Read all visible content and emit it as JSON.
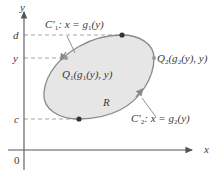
{
  "axes": {
    "x_label": "x",
    "y_label": "y",
    "origin_label": "0"
  },
  "y_ticks": {
    "d": "d",
    "y": "y",
    "c": "c"
  },
  "curves": {
    "c1_label": "C′",
    "c1_sub": "1",
    "c1_eq": ": x = g",
    "c1_eq_sub": "1",
    "c1_eq_tail": "(y)",
    "c2_label": "C′",
    "c2_sub": "2",
    "c2_eq": ": x = g",
    "c2_eq_sub": "2",
    "c2_eq_tail": "(y)"
  },
  "points": {
    "q1_name": "Q",
    "q1_sub": "1",
    "q1_args": "(g",
    "q1_args_sub": "1",
    "q1_tail": "(y), y)",
    "q2_name": "Q",
    "q2_sub": "2",
    "q2_args": "(g",
    "q2_args_sub": "2",
    "q2_tail": "(y), y)"
  },
  "region": {
    "label": "R"
  },
  "colors": {
    "region_fill": "#e6e6e6",
    "curve_stroke": "#8a8a8a",
    "axis": "#555555",
    "dash": "#9a9a9a",
    "point": "#333333"
  }
}
